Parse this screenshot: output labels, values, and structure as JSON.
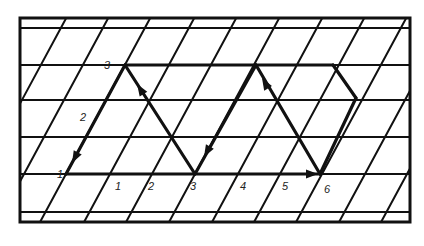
{
  "diagram": {
    "type": "skewed-grid-path",
    "colors": {
      "line": "#111111",
      "background": "#ffffff"
    },
    "border": {
      "x1": 20,
      "y1": 18,
      "x2": 410,
      "y2": 222
    },
    "horizontal_lines_y": [
      28,
      65,
      100,
      137,
      174,
      212
    ],
    "slant_dx_per_dy": 0.54,
    "slant_lines_x_at_y174": [
      24,
      66,
      110,
      152,
      195,
      238,
      280,
      322,
      365,
      407
    ],
    "axis_labels": {
      "left_axis": [
        {
          "text": "1",
          "x": 57,
          "y": 178
        },
        {
          "text": "2",
          "x": 80,
          "y": 121
        },
        {
          "text": "3",
          "x": 104,
          "y": 69
        }
      ],
      "bottom_axis": [
        {
          "text": "1",
          "x": 115,
          "y": 190
        },
        {
          "text": "2",
          "x": 148,
          "y": 190
        },
        {
          "text": "3",
          "x": 190,
          "y": 190
        },
        {
          "text": "4",
          "x": 240,
          "y": 190
        },
        {
          "text": "5",
          "x": 282,
          "y": 190
        },
        {
          "text": "6",
          "x": 324,
          "y": 193
        }
      ]
    },
    "path_segments": [
      {
        "from": [
          66,
          174
        ],
        "to": [
          320,
          174
        ],
        "arrow": "end",
        "arrow_at": [
          318,
          174
        ]
      },
      {
        "from": [
          125,
          65
        ],
        "to": [
          66,
          174
        ],
        "arrow": "end",
        "arrow_at": [
          72,
          163
        ]
      },
      {
        "from": [
          125,
          65
        ],
        "to": [
          333,
          65
        ],
        "arrow": "none"
      },
      {
        "from": [
          195,
          174
        ],
        "to": [
          125,
          65
        ],
        "arrow": "mid",
        "arrow_at": [
          137,
          84
        ]
      },
      {
        "from": [
          256,
          65
        ],
        "to": [
          195,
          174
        ],
        "arrow": "mid",
        "arrow_at": [
          204,
          157
        ]
      },
      {
        "from": [
          320,
          174
        ],
        "to": [
          256,
          65
        ],
        "arrow": "mid",
        "arrow_at": [
          262,
          78
        ]
      },
      {
        "from": [
          333,
          65
        ],
        "to": [
          356,
          98
        ],
        "arrow": "none"
      },
      {
        "from": [
          356,
          98
        ],
        "to": [
          320,
          174
        ],
        "arrow": "none"
      }
    ]
  }
}
